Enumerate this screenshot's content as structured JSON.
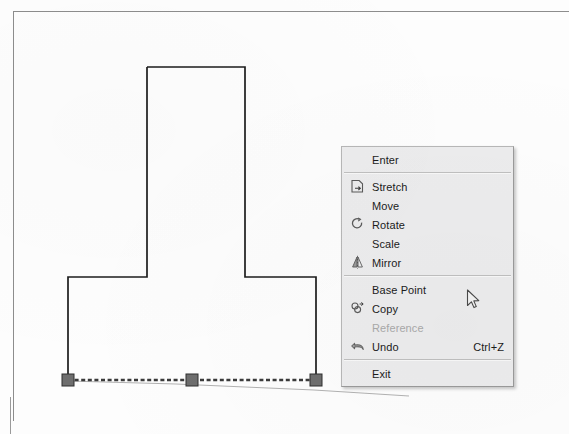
{
  "app": {
    "type": "cad-drawing-editor",
    "background_color": "#fdfdfd"
  },
  "drawing": {
    "name": "inverted-t-profile",
    "line_color": "#1a1a1a",
    "selection_color": "#6d6d6d",
    "grip_color": "#7a7a7a",
    "shape_label": "inverted T shape polyline",
    "grips": [
      {
        "name": "grip-left",
        "x": 68,
        "y": 380
      },
      {
        "name": "grip-middle",
        "x": 194,
        "y": 380
      },
      {
        "name": "grip-right",
        "x": 316,
        "y": 380
      }
    ],
    "stretch_preview_label": "stretch rubber-band line"
  },
  "context_menu": {
    "name": "stretch-context-menu",
    "background_color": "#ececed",
    "border_color": "#b7b7b7",
    "items": [
      {
        "label": "Enter",
        "icon": "none",
        "accel": "",
        "enabled": true,
        "separator_after": true
      },
      {
        "label": "Stretch",
        "icon": "stretch-icon",
        "accel": "",
        "enabled": true,
        "separator_after": false
      },
      {
        "label": "Move",
        "icon": "none",
        "accel": "",
        "enabled": true,
        "separator_after": false
      },
      {
        "label": "Rotate",
        "icon": "rotate-icon",
        "accel": "",
        "enabled": true,
        "separator_after": false
      },
      {
        "label": "Scale",
        "icon": "none",
        "accel": "",
        "enabled": true,
        "separator_after": false
      },
      {
        "label": "Mirror",
        "icon": "mirror-icon",
        "accel": "",
        "enabled": true,
        "separator_after": true
      },
      {
        "label": "Base Point",
        "icon": "none",
        "accel": "",
        "enabled": true,
        "separator_after": false
      },
      {
        "label": "Copy",
        "icon": "copy-icon",
        "accel": "",
        "enabled": true,
        "separator_after": false
      },
      {
        "label": "Reference",
        "icon": "none",
        "accel": "",
        "enabled": false,
        "separator_after": false
      },
      {
        "label": "Undo",
        "icon": "undo-icon",
        "accel": "Ctrl+Z",
        "enabled": true,
        "separator_after": true
      },
      {
        "label": "Exit",
        "icon": "none",
        "accel": "",
        "enabled": true,
        "separator_after": false
      }
    ]
  },
  "cursor": {
    "name": "mouse-pointer",
    "x": 468,
    "y": 291
  }
}
